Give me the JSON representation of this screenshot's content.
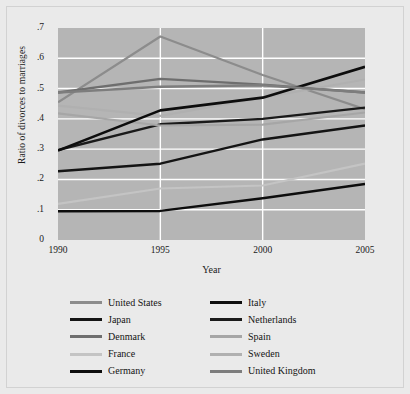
{
  "chart_data": {
    "type": "line",
    "title": "",
    "xlabel": "Year",
    "ylabel": "Ratio of divorces to marriages",
    "x": [
      1990,
      1995,
      2000,
      2005
    ],
    "xlim": [
      1990,
      2005
    ],
    "ylim": [
      0,
      0.7
    ],
    "xticks": [
      "1990",
      "1995",
      "2000",
      "2005"
    ],
    "yticks": [
      ".7",
      ".6",
      ".5",
      ".4",
      ".3",
      ".2",
      ".1",
      "0"
    ],
    "ytick_values": [
      0.7,
      0.6,
      0.5,
      0.4,
      0.3,
      0.2,
      0.1,
      0
    ],
    "grid": "horizontal-and-vertical-white",
    "legend_position": "below",
    "series": [
      {
        "name": "United States",
        "color": "#8c8c8c",
        "width": 2.2,
        "values": [
          0.455,
          0.672,
          0.545,
          0.432
        ]
      },
      {
        "name": "Italy",
        "color": "#0d0d0d",
        "width": 2.4,
        "values": [
          0.095,
          0.096,
          0.138,
          0.185
        ]
      },
      {
        "name": "Japan",
        "color": "#141414",
        "width": 2.4,
        "values": [
          0.227,
          0.252,
          0.332,
          0.378
        ]
      },
      {
        "name": "Netherlands",
        "color": "#1a1a1a",
        "width": 2.4,
        "values": [
          0.297,
          0.382,
          0.4,
          0.437
        ]
      },
      {
        "name": "Denmark",
        "color": "#6e6e6e",
        "width": 2.4,
        "values": [
          0.487,
          0.532,
          0.513,
          0.487
        ]
      },
      {
        "name": "Spain",
        "color": "#a6a6a6",
        "width": 2.2,
        "values": [
          0.418,
          0.378,
          0.381,
          0.421
        ]
      },
      {
        "name": "France",
        "color": "#c4c4c4",
        "width": 2.2,
        "values": [
          0.119,
          0.17,
          0.18,
          0.252
        ]
      },
      {
        "name": "Sweden",
        "color": "#b0b0b0",
        "width": 2.2,
        "values": [
          0.444,
          0.41,
          0.47,
          0.53
        ]
      },
      {
        "name": "Germany",
        "color": "#0d0d0d",
        "width": 2.6,
        "values": [
          0.295,
          0.428,
          0.47,
          0.572
        ]
      },
      {
        "name": "United Kingdom",
        "color": "#7d7d7d",
        "width": 2.4,
        "values": [
          0.487,
          0.506,
          0.511,
          0.487
        ]
      }
    ]
  },
  "legend": {
    "items": [
      {
        "label": "United States",
        "color": "#8c8c8c"
      },
      {
        "label": "Italy",
        "color": "#0d0d0d"
      },
      {
        "label": "Japan",
        "color": "#141414"
      },
      {
        "label": "Netherlands",
        "color": "#1a1a1a"
      },
      {
        "label": "Denmark",
        "color": "#6e6e6e"
      },
      {
        "label": "Spain",
        "color": "#a6a6a6"
      },
      {
        "label": "France",
        "color": "#c4c4c4"
      },
      {
        "label": "Sweden",
        "color": "#b0b0b0"
      },
      {
        "label": "Germany",
        "color": "#0d0d0d"
      },
      {
        "label": "United Kingdom",
        "color": "#7d7d7d"
      }
    ]
  },
  "colors": {
    "background": "#eaeaea",
    "plot_background": "#b5b5b5",
    "gridline": "#ffffff",
    "text": "#1a1a1a"
  }
}
